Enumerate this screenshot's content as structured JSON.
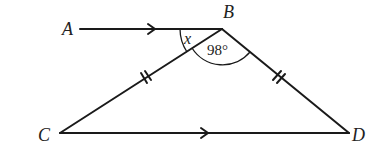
{
  "diagram": {
    "type": "geometry",
    "points": {
      "A": {
        "label": "A",
        "x": 80,
        "y": 29
      },
      "B": {
        "label": "B",
        "x": 222,
        "y": 29
      },
      "C": {
        "label": "C",
        "x": 60,
        "y": 133
      },
      "D": {
        "label": "D",
        "x": 349,
        "y": 133
      }
    },
    "segments": [
      "AB",
      "BC",
      "BD",
      "CD"
    ],
    "parallel_marks": [
      "AB",
      "CD"
    ],
    "equal_length_marks": {
      "segments": [
        "BC",
        "BD"
      ],
      "ticks": 2
    },
    "angles": {
      "ABC": {
        "label": "x"
      },
      "CBD": {
        "label": "98°"
      }
    },
    "color": "#1a1a1a"
  }
}
